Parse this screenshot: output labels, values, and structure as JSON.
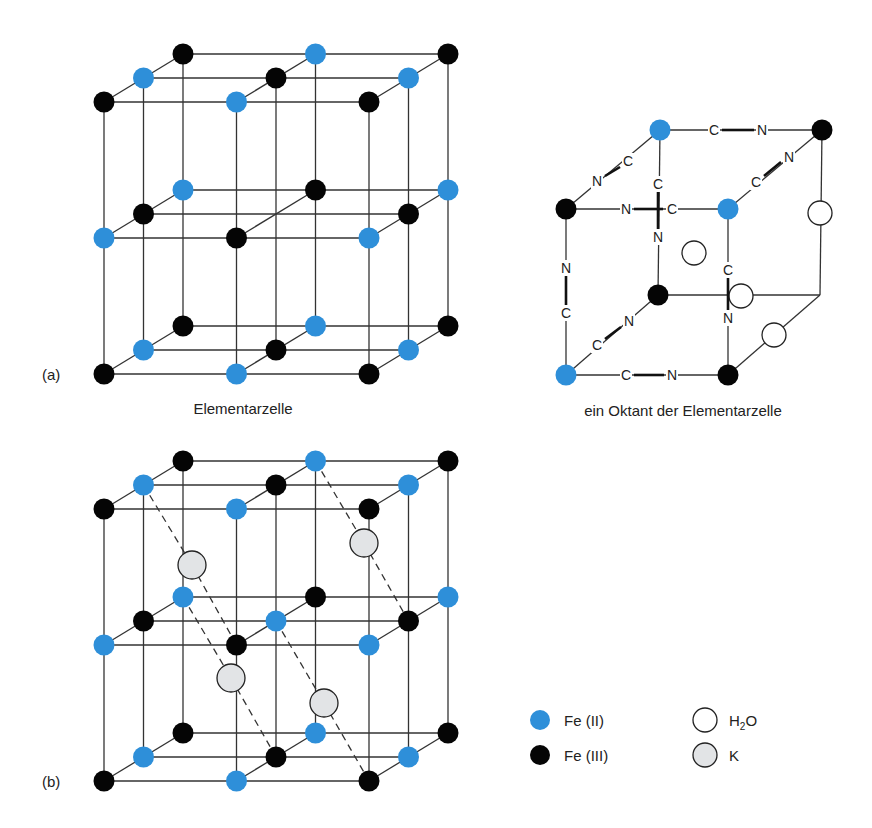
{
  "colors": {
    "fe2": "#2e8fd9",
    "fe3": "#050505",
    "h2o_fill": "#ffffff",
    "k_fill": "#e2e4e6",
    "line": "#333333"
  },
  "panel_a": {
    "label": "(a)",
    "caption": "Elementarzelle",
    "octant_caption": "ein Oktant der Elementarzelle"
  },
  "panel_b": {
    "label": "(b)"
  },
  "octant": {
    "bond_labels": [
      "C",
      "N"
    ]
  },
  "legend": {
    "items": [
      {
        "symbol": "blue-dot",
        "label": "Fe (II)"
      },
      {
        "symbol": "black-dot",
        "label": "Fe (III)"
      },
      {
        "symbol": "white-circle",
        "label": "H2O",
        "text_main": "H",
        "text_sub": "2",
        "text_end": "O"
      },
      {
        "symbol": "gray-circle",
        "label": "K"
      }
    ]
  }
}
